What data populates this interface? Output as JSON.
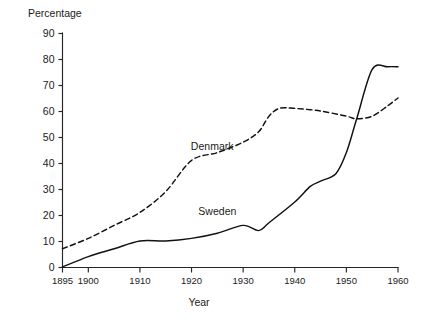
{
  "chart_data": {
    "type": "line",
    "title": "",
    "xlabel": "Year",
    "ylabel": "Percentage",
    "xlim": [
      1895,
      1960
    ],
    "ylim": [
      0,
      90
    ],
    "grid": false,
    "legend_position": "inline-annotations",
    "xticks": [
      1895,
      1900,
      1910,
      1920,
      1930,
      1940,
      1950,
      1960
    ],
    "xtick_labels": [
      "1895",
      "1900",
      "1910",
      "1920",
      "1930",
      "1940",
      "1950",
      "1960"
    ],
    "yticks": [
      0,
      10,
      20,
      30,
      40,
      50,
      60,
      70,
      80,
      90
    ],
    "ytick_labels": [
      "0",
      "10",
      "20",
      "30",
      "40",
      "50",
      "60",
      "70",
      "80",
      "90"
    ],
    "series": [
      {
        "name": "Denmark",
        "style": "dashed",
        "color": "#111111",
        "label_x": 1924,
        "label_y": 46,
        "x": [
          1895,
          1900,
          1905,
          1910,
          1915,
          1920,
          1925,
          1930,
          1933,
          1935,
          1937,
          1940,
          1945,
          1950,
          1952,
          1955,
          1958,
          1960
        ],
        "y": [
          7,
          11,
          16,
          21,
          29,
          41,
          44,
          48,
          52,
          58,
          61,
          61,
          60,
          58,
          57,
          58,
          62,
          65
        ]
      },
      {
        "name": "Sweden",
        "style": "solid",
        "color": "#111111",
        "label_x": 1925,
        "label_y": 21,
        "x": [
          1895,
          1900,
          1905,
          1910,
          1915,
          1920,
          1925,
          1930,
          1933,
          1935,
          1940,
          1943,
          1945,
          1948,
          1950,
          1952,
          1955,
          1958,
          1960
        ],
        "y": [
          0,
          4,
          7,
          10,
          10,
          11,
          13,
          16,
          14,
          17,
          25,
          31,
          33,
          36,
          44,
          57,
          76,
          77,
          77
        ]
      }
    ]
  },
  "axis_titles": {
    "y": "Percentage",
    "x": "Year"
  }
}
